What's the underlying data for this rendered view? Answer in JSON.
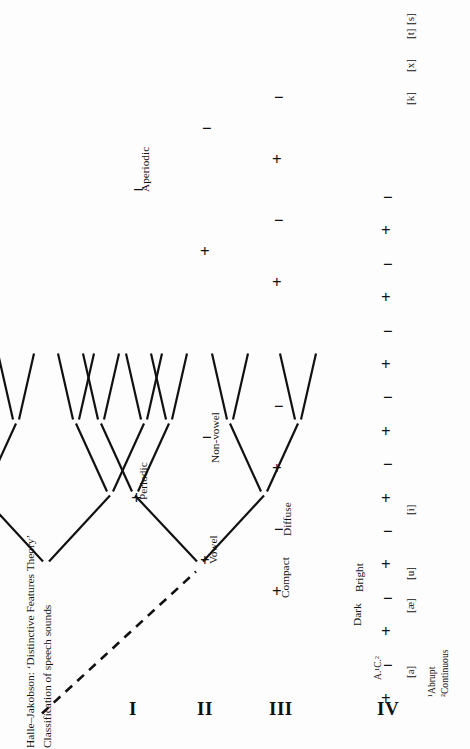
{
  "document": {
    "title_line1": "Halle–Jakobson: ‘Distinctive Features Theory’",
    "title_line2": "Classification of speech sounds",
    "orientation": "rotated-90-ccw"
  },
  "levels": [
    {
      "numeral": "I",
      "label": "Level I"
    },
    {
      "numeral": "II",
      "label": "Level II"
    },
    {
      "numeral": "III",
      "label": "Level III"
    },
    {
      "numeral": "IV",
      "label": "Level IV"
    }
  ],
  "signs": {
    "plus": "+",
    "minus": "−"
  },
  "branch_labels": [
    {
      "id": "periodic",
      "text": "Periodic",
      "sign": "+",
      "level": 1
    },
    {
      "id": "aperiodic",
      "text": "Aperiodic",
      "sign": "−",
      "level": 1
    },
    {
      "id": "vowel",
      "text": "Vowel",
      "sign": "+",
      "level": 2
    },
    {
      "id": "non-vowel",
      "text": "Non-vowel",
      "sign": "−",
      "level": 2
    },
    {
      "id": "compact",
      "text": "Compact",
      "sign": "+",
      "level": 3
    },
    {
      "id": "diffuse",
      "text": "Diffuse",
      "sign": "−",
      "level": 3
    },
    {
      "id": "dark",
      "text": "Dark",
      "sign": "+",
      "level": 4
    },
    {
      "id": "bright",
      "text": "Bright",
      "sign": "−",
      "level": 4
    },
    {
      "id": "abrupt-continuous",
      "text": "A.¹C.²",
      "sign": "",
      "level": 5
    }
  ],
  "leaf_labels": [
    {
      "id": "leaf-a",
      "text": "[a]"
    },
    {
      "id": "leaf-ae",
      "text": "[æ]"
    },
    {
      "id": "leaf-u",
      "text": "[u]"
    },
    {
      "id": "leaf-i",
      "text": "[i]"
    },
    {
      "id": "leaf-k",
      "text": "[k]"
    },
    {
      "id": "leaf-x",
      "text": "[x]"
    },
    {
      "id": "leaf-t",
      "text": "[t]"
    },
    {
      "id": "leaf-s",
      "text": "[s]"
    }
  ],
  "footnotes": [
    {
      "marker": "¹",
      "text": "¹Abrupt"
    },
    {
      "marker": "²",
      "text": "²Continuous"
    }
  ],
  "chart_data": {
    "type": "tree",
    "structure": "binary",
    "depth": 4,
    "leaf_count": 16,
    "root": {
      "sign": "+",
      "label": "Periodic"
    },
    "nodes": [
      {
        "level": 1,
        "sign": "+",
        "label": "Periodic"
      },
      {
        "level": 1,
        "sign": "−",
        "label": "Aperiodic"
      },
      {
        "level": 2,
        "sign": "+",
        "label": "Vowel",
        "parent": "Periodic"
      },
      {
        "level": 2,
        "sign": "−",
        "label": "Non-vowel",
        "parent": "Periodic"
      },
      {
        "level": 2,
        "sign": "+",
        "label": "",
        "parent": "Aperiodic"
      },
      {
        "level": 2,
        "sign": "−",
        "label": "",
        "parent": "Aperiodic"
      },
      {
        "level": 3,
        "sign": "+",
        "label": "Compact"
      },
      {
        "level": 3,
        "sign": "−",
        "label": "Diffuse"
      },
      {
        "level": 4,
        "sign": "+",
        "label": "Dark"
      },
      {
        "level": 4,
        "sign": "−",
        "label": "Bright"
      }
    ],
    "terminal_symbols": [
      "[a]",
      "[æ]",
      "[u]",
      "[i]",
      "[k]",
      "[x]",
      "[t]",
      "[s]"
    ],
    "notes": [
      "¹Abrupt",
      "²Continuous"
    ]
  }
}
